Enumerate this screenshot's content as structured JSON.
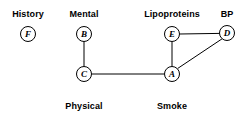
{
  "figure": {
    "type": "undirected-graph-diagram",
    "width": 252,
    "height": 121,
    "background_color": "#ffffff",
    "line_color": "#000000",
    "text_color": "#000000"
  },
  "nodes": [
    {
      "id": "F",
      "letter": "F",
      "label": "History",
      "label_position": "above",
      "x": 28,
      "y": 34,
      "r": 7.5,
      "label_x": 28,
      "label_y": 14
    },
    {
      "id": "B",
      "letter": "B",
      "label": "Mental",
      "label_position": "above",
      "x": 84,
      "y": 34,
      "r": 7.5,
      "label_x": 84,
      "label_y": 14
    },
    {
      "id": "C",
      "letter": "C",
      "label": "Physical",
      "label_position": "below",
      "x": 84,
      "y": 74,
      "r": 7.5,
      "label_x": 84,
      "label_y": 106
    },
    {
      "id": "A",
      "letter": "A",
      "label": "Smoke",
      "label_position": "below",
      "x": 172,
      "y": 74,
      "r": 7.5,
      "label_x": 172,
      "label_y": 106
    },
    {
      "id": "E",
      "letter": "E",
      "label": "Lipoproteins",
      "label_position": "above",
      "x": 172,
      "y": 34,
      "r": 7.5,
      "label_x": 172,
      "label_y": 14
    },
    {
      "id": "D",
      "letter": "D",
      "label": "BP",
      "label_position": "above",
      "x": 227,
      "y": 33,
      "r": 7.5,
      "label_x": 227,
      "label_y": 14
    }
  ],
  "edges": [
    {
      "id": "edge-B-C",
      "from": "B",
      "to": "C",
      "x1": 84,
      "y1": 41.5,
      "x2": 84,
      "y2": 66.5
    },
    {
      "id": "edge-C-A",
      "from": "C",
      "to": "A",
      "x1": 91.5,
      "y1": 74,
      "x2": 164.5,
      "y2": 74
    },
    {
      "id": "edge-E-A",
      "from": "E",
      "to": "A",
      "x1": 172,
      "y1": 41.5,
      "x2": 172,
      "y2": 66.5
    },
    {
      "id": "edge-E-D",
      "from": "E",
      "to": "D",
      "x1": 179.5,
      "y1": 34,
      "x2": 219.5,
      "y2": 33.4
    },
    {
      "id": "edge-A-D",
      "from": "A",
      "to": "D",
      "x1": 177.6,
      "y1": 68.5,
      "x2": 222.1,
      "y2": 38.8
    }
  ],
  "labels": {
    "history": "History",
    "mental": "Mental",
    "lipoproteins": "Lipoproteins",
    "bp": "BP",
    "physical": "Physical",
    "smoke": "Smoke"
  },
  "letters": {
    "a": "A",
    "b": "B",
    "c": "C",
    "d": "D",
    "e": "E",
    "f": "F"
  }
}
